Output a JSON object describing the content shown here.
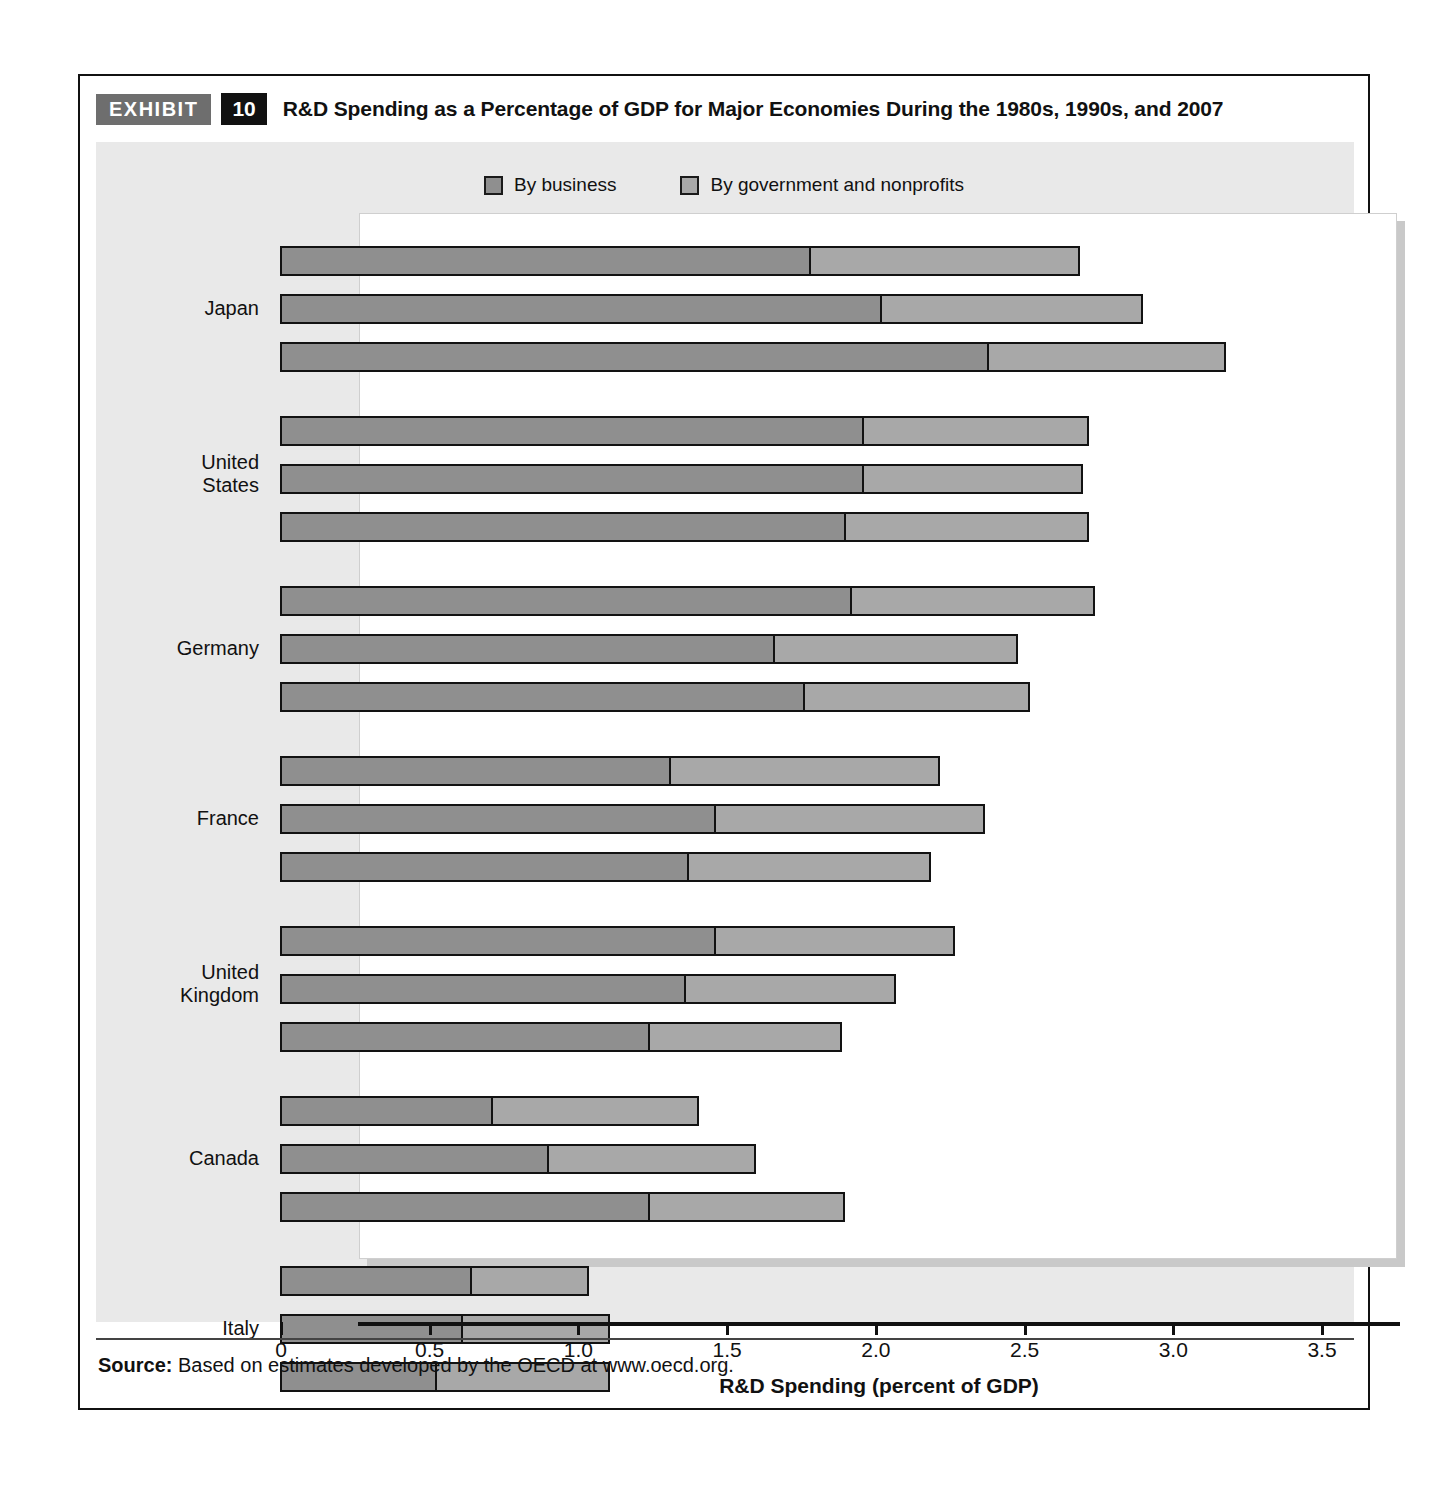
{
  "exhibit": {
    "tag": "EXHIBIT",
    "number": "10",
    "title": "R&D Spending as a Percentage of GDP for Major Economies During the 1980s, 1990s, and 2007"
  },
  "source": {
    "label": "Source:",
    "text": " Based on estimates developed by the OECD at www.oecd.org."
  },
  "legend": {
    "items": [
      {
        "label": "By business",
        "color": "#8f8f8f"
      },
      {
        "label": "By government and nonprofits",
        "color": "#a8a8a8"
      }
    ]
  },
  "colors": {
    "business": "#8f8f8f",
    "government": "#a8a8a8",
    "outline": "#121212",
    "panel": "#e9e9e9",
    "tag_gray": "#6e6e6e",
    "tag_black": "#111111"
  },
  "chart_data": {
    "type": "bar",
    "orientation": "horizontal",
    "stacked": true,
    "title": "R&D Spending as a Percentage of GDP for Major Economies During the 1980s, 1990s, and 2007",
    "xlabel": "R&D Spending (percent of GDP)",
    "ylabel": "",
    "xlim": [
      0,
      3.5
    ],
    "xticks": [
      0,
      0.5,
      1.0,
      1.5,
      2.0,
      2.5,
      3.0,
      3.5
    ],
    "xtick_labels": [
      "0",
      "0.5",
      "1.0",
      "1.5",
      "2.0",
      "2.5",
      "3.0",
      "3.5"
    ],
    "grid": false,
    "legend_position": "top-center",
    "series": [
      {
        "name": "By business",
        "color": "#8f8f8f"
      },
      {
        "name": "By government and nonprofits",
        "color": "#a8a8a8"
      }
    ],
    "groups": [
      {
        "name": "Japan",
        "rows": [
          {
            "period": "1980s",
            "business": 1.78,
            "government": 0.91,
            "total": 2.69
          },
          {
            "period": "1990s",
            "business": 2.02,
            "government": 0.88,
            "total": 2.9
          },
          {
            "period": "2007",
            "business": 2.38,
            "government": 0.8,
            "total": 3.18
          }
        ]
      },
      {
        "name": "United States",
        "rows": [
          {
            "period": "1980s",
            "business": 1.96,
            "government": 0.76,
            "total": 2.72
          },
          {
            "period": "1990s",
            "business": 1.96,
            "government": 0.74,
            "total": 2.7
          },
          {
            "period": "2007",
            "business": 1.9,
            "government": 0.82,
            "total": 2.72
          }
        ]
      },
      {
        "name": "Germany",
        "rows": [
          {
            "period": "1980s",
            "business": 1.92,
            "government": 0.82,
            "total": 2.74
          },
          {
            "period": "1990s",
            "business": 1.66,
            "government": 0.82,
            "total": 2.48
          },
          {
            "period": "2007",
            "business": 1.76,
            "government": 0.76,
            "total": 2.52
          }
        ]
      },
      {
        "name": "France",
        "rows": [
          {
            "period": "1980s",
            "business": 1.31,
            "government": 0.91,
            "total": 2.22
          },
          {
            "period": "1990s",
            "business": 1.46,
            "government": 0.91,
            "total": 2.37
          },
          {
            "period": "2007",
            "business": 1.37,
            "government": 0.82,
            "total": 2.19
          }
        ]
      },
      {
        "name": "United Kingdom",
        "rows": [
          {
            "period": "1980s",
            "business": 1.46,
            "government": 0.81,
            "total": 2.27
          },
          {
            "period": "1990s",
            "business": 1.36,
            "government": 0.71,
            "total": 2.07
          },
          {
            "period": "2007",
            "business": 1.24,
            "government": 0.65,
            "total": 1.89
          }
        ]
      },
      {
        "name": "Canada",
        "rows": [
          {
            "period": "1980s",
            "business": 0.71,
            "government": 0.7,
            "total": 1.41
          },
          {
            "period": "1990s",
            "business": 0.9,
            "government": 0.7,
            "total": 1.6
          },
          {
            "period": "2007",
            "business": 1.24,
            "government": 0.66,
            "total": 1.9
          }
        ]
      },
      {
        "name": "Italy",
        "rows": [
          {
            "period": "1980s",
            "business": 0.64,
            "government": 0.4,
            "total": 1.04
          },
          {
            "period": "1990s",
            "business": 0.61,
            "government": 0.5,
            "total": 1.11
          },
          {
            "period": "2007",
            "business": 0.52,
            "government": 0.59,
            "total": 1.11
          }
        ]
      }
    ]
  }
}
